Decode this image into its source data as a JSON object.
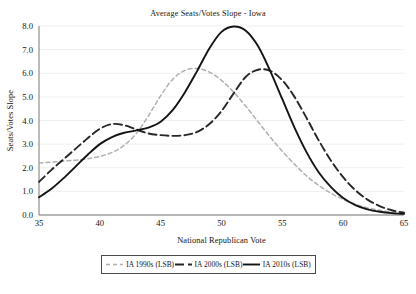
{
  "chart_data": {
    "type": "line",
    "title": "Average Seats/Votes Slope - Iowa",
    "xlabel": "National Republican Vote",
    "ylabel": "Seats/Votes Slope",
    "xlim": [
      35,
      65
    ],
    "ylim": [
      0.0,
      8.0
    ],
    "xticks": [
      "35",
      "40",
      "45",
      "50",
      "55",
      "60",
      "65"
    ],
    "yticks": [
      "0.0",
      "1.0",
      "2.0",
      "3.0",
      "4.0",
      "5.0",
      "6.0",
      "7.0",
      "8.0"
    ],
    "grid": "horizontal",
    "legend_position": "below",
    "x": [
      35,
      36,
      37,
      38,
      39,
      40,
      41,
      42,
      43,
      44,
      45,
      46,
      47,
      48,
      49,
      50,
      51,
      52,
      53,
      54,
      55,
      56,
      57,
      58,
      59,
      60,
      61,
      62,
      63,
      64,
      65
    ],
    "series": [
      {
        "name": "IA 1990s (LSB)",
        "color": "#b0b0b0",
        "style": "dashed",
        "values": [
          2.2,
          2.24,
          2.28,
          2.32,
          2.38,
          2.48,
          2.65,
          2.95,
          3.45,
          4.2,
          5.05,
          5.75,
          6.12,
          6.2,
          6.05,
          5.7,
          5.2,
          4.6,
          3.95,
          3.3,
          2.7,
          2.15,
          1.65,
          1.25,
          0.92,
          0.66,
          0.46,
          0.3,
          0.2,
          0.12,
          0.07
        ]
      },
      {
        "name": "IA 2000s (LSB)",
        "color": "#262626",
        "style": "long-dashed",
        "values": [
          1.4,
          1.9,
          2.35,
          2.8,
          3.25,
          3.65,
          3.85,
          3.8,
          3.62,
          3.45,
          3.38,
          3.35,
          3.38,
          3.52,
          3.85,
          4.4,
          5.15,
          5.85,
          6.15,
          6.1,
          5.7,
          5.0,
          4.1,
          3.15,
          2.3,
          1.6,
          1.05,
          0.65,
          0.38,
          0.2,
          0.1
        ]
      },
      {
        "name": "IA 2010s (LSB)",
        "color": "#141414",
        "style": "solid",
        "values": [
          0.75,
          1.1,
          1.55,
          2.05,
          2.55,
          3.0,
          3.3,
          3.48,
          3.58,
          3.7,
          3.95,
          4.45,
          5.2,
          6.1,
          7.05,
          7.75,
          7.98,
          7.8,
          7.15,
          6.1,
          4.9,
          3.7,
          2.65,
          1.8,
          1.18,
          0.72,
          0.42,
          0.24,
          0.14,
          0.08,
          0.05
        ]
      }
    ]
  },
  "legend": {
    "entries": [
      {
        "label": "IA 1990s (LSB)"
      },
      {
        "label": "IA 2000s (LSB)"
      },
      {
        "label": "IA 2010s (LSB)"
      }
    ]
  },
  "caption": {
    "text": ""
  }
}
